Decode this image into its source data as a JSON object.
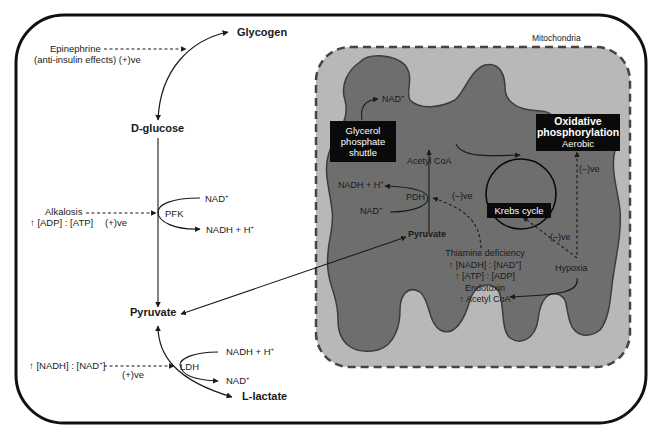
{
  "colors": {
    "cell_border": "#111111",
    "mito_outer_fill": "#b8b8b8",
    "mito_outer_border": "#444444",
    "mito_inner_fill": "#6e6e6e",
    "mito_inner_border": "#3c3c3c",
    "box_fill": "#0a0a0a",
    "box_text": "#ffffff",
    "text": "#1a1a1a"
  },
  "cytoplasm": {
    "glycogen": "Glycogen",
    "d_glucose": "D-glucose",
    "pyruvate": "Pyruvate",
    "l_lactate": "L-lactate",
    "epinephrine": {
      "line1": "Epinephrine",
      "line2": "(anti-insulin effects) (+)ve"
    },
    "pfk": {
      "enzyme": "PFK",
      "nad_in": "NAD",
      "nad_in_sup": "+",
      "nadh_out": "NADH + H",
      "nadh_out_sup": "+"
    },
    "alkalosis": {
      "line1": "Alkalosis",
      "line2": "↑ [ADP] : [ATP]",
      "effect": "(+)ve"
    },
    "ldh": {
      "enzyme": "LDH",
      "nadh_in": "NADH + H",
      "nadh_in_sup": "+",
      "nad_out": "NAD",
      "nad_out_sup": "+"
    },
    "nadh_ratio": {
      "text_a": "↑ [NADH] : [NAD",
      "text_sup": "+",
      "text_b": "]",
      "effect": "(+)ve"
    }
  },
  "mitochondria": {
    "label": "Mitochondria",
    "glycerol_box": {
      "line1": "Glycerol",
      "line2": "phosphate",
      "line3": "shuttle"
    },
    "nad_top": "NAD",
    "nad_top_sup": "+",
    "acetyl_coa": "Acetyl CoA",
    "nadh_h": "NADH + H",
    "nadh_h_sup": "+",
    "pdh": "PDH",
    "pdh_effect": "(–)ve",
    "nad_pdh": "NAD",
    "nad_pdh_sup": "+",
    "pyruvate": "Pyruvate",
    "krebs_box": "Krebs cycle",
    "krebs_effect": "(–)ve",
    "oxphos_box": {
      "line1": "Oxidative",
      "line2": "phosphorylation",
      "line3": "Aerobic"
    },
    "oxphos_effect": "(–)ve",
    "hypoxia": "Hypoxia",
    "inhibitors": {
      "line1": "Thiamine deficiency",
      "line2a": "↑ [NADH] : [NAD",
      "line2sup": "+",
      "line2b": "]",
      "line3": "↑ [ATP] : [ADP]",
      "line4": "Endotoxin",
      "line5": "↑ Acetyl CoA"
    }
  }
}
